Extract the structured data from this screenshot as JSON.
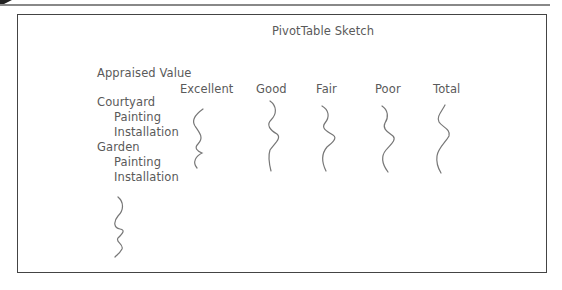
{
  "sketch": {
    "title": "PivotTable Sketch",
    "row_field_label": "Appraised Value",
    "column_headers": [
      "Excellent",
      "Good",
      "Fair",
      "Poor",
      "Total"
    ],
    "rows": [
      {
        "label": "Courtyard",
        "level": 0
      },
      {
        "label": "Painting",
        "level": 1
      },
      {
        "label": "Installation",
        "level": 1
      },
      {
        "label": "Garden",
        "level": 0
      },
      {
        "label": "Painting",
        "level": 1
      },
      {
        "label": "Installation",
        "level": 1
      }
    ],
    "placeholder_marks": [
      "squiggle-excellent",
      "squiggle-good",
      "squiggle-fair",
      "squiggle-poor",
      "squiggle-total",
      "squiggle-rows-continued"
    ]
  },
  "colors": {
    "frame": "#444444",
    "text": "#5a5a5a",
    "squiggle": "#777777"
  }
}
